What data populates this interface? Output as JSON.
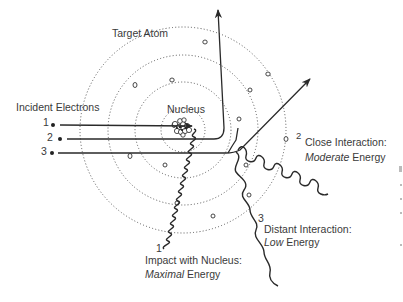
{
  "diagram": {
    "title": "Target Atom",
    "nucleus_label": "Nucleus",
    "incident_label": "Incident Electrons",
    "electrons": [
      {
        "number": "1",
        "label": "1"
      },
      {
        "number": "2",
        "label": "2"
      },
      {
        "number": "3",
        "label": "3"
      }
    ],
    "interactions": [
      {
        "number": "1",
        "line1": "Impact with Nucleus:",
        "emphasis": "Maximal",
        "suffix": " Energy"
      },
      {
        "number": "2",
        "line1": "Close Interaction:",
        "emphasis": "Moderate",
        "suffix": " Energy"
      },
      {
        "number": "3",
        "line1": "Distant Interaction:",
        "emphasis": "Low",
        "suffix": " Energy"
      }
    ]
  },
  "colors": {
    "line": "#2a2a2a",
    "text": "#3a3a3a",
    "background": "#ffffff"
  }
}
